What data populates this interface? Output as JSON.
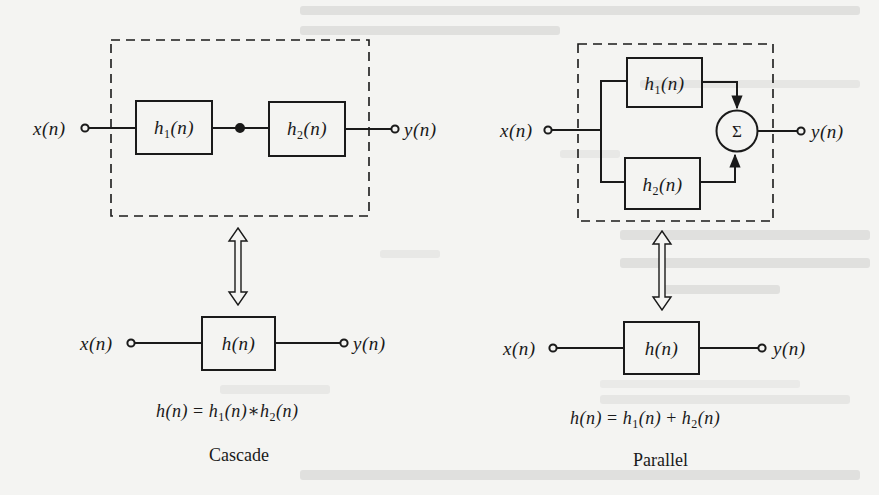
{
  "figure": {
    "colors": {
      "paper": "#f4f4f2",
      "ink": "#1a1a1a",
      "bleed_through": "#dcdcda"
    },
    "cascade": {
      "caption": "Cascade",
      "input_label": "x(n)",
      "output_label": "y(n)",
      "blocks": [
        {
          "name": "h",
          "sub": "1",
          "arg": "(n)"
        },
        {
          "name": "h",
          "sub": "2",
          "arg": "(n)"
        }
      ],
      "junction": "dot",
      "grouping": "dashed-box",
      "equivalence_arrow": "double-headed-hollow-arrow",
      "equivalent": {
        "input_label": "x(n)",
        "output_label": "y(n)",
        "block_label": "h(n)"
      },
      "equation": {
        "lhs": "h(n)",
        "equals": "=",
        "term1": {
          "name": "h",
          "sub": "1",
          "arg": "(n)"
        },
        "operator": "∗",
        "term2": {
          "name": "h",
          "sub": "2",
          "arg": "(n)"
        },
        "full_text": "h(n) = h1(n) * h2(n)"
      }
    },
    "parallel": {
      "caption": "Parallel",
      "input_label": "x(n)",
      "output_label": "y(n)",
      "blocks": [
        {
          "name": "h",
          "sub": "1",
          "arg": "(n)"
        },
        {
          "name": "h",
          "sub": "2",
          "arg": "(n)"
        }
      ],
      "summer_symbol": "Σ",
      "grouping": "dashed-box",
      "equivalence_arrow": "double-headed-hollow-arrow",
      "equivalent": {
        "input_label": "x(n)",
        "output_label": "y(n)",
        "block_label": "h(n)"
      },
      "equation": {
        "lhs": "h(n)",
        "equals": "=",
        "term1": {
          "name": "h",
          "sub": "1",
          "arg": "(n)"
        },
        "operator": "+",
        "term2": {
          "name": "h",
          "sub": "2",
          "arg": "(n)"
        },
        "full_text": "h(n) = h1(n) + h2(n)"
      }
    }
  }
}
